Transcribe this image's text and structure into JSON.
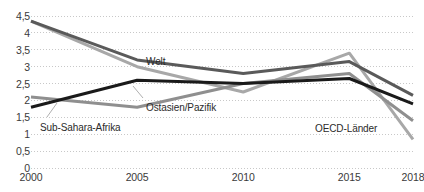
{
  "chart_data": {
    "type": "line",
    "title": "",
    "xlabel": "",
    "ylabel": "",
    "x": [
      2000,
      2005,
      2010,
      2015,
      2018
    ],
    "categories": [
      "2000",
      "2005",
      "2010",
      "2015",
      "2018"
    ],
    "xlim": [
      2000,
      2018
    ],
    "ylim": [
      0,
      4.5
    ],
    "ytick_values": [
      0,
      0.5,
      1,
      1.5,
      2,
      2.5,
      3,
      3.5,
      4,
      4.5
    ],
    "ytick_labels": [
      "0",
      "0,5",
      "1",
      "1,5",
      "2",
      "2,5",
      "3",
      "3,5",
      "4",
      "4,5"
    ],
    "xtick_labels": [
      "2000",
      "2005",
      "2010",
      "2015",
      "2018"
    ],
    "grid": "horizontal-dotted",
    "legend_position": "inline-annotations",
    "series": [
      {
        "name": "Welt",
        "color": "#5a5a5a",
        "values": [
          4.35,
          3.2,
          2.8,
          3.15,
          2.15
        ]
      },
      {
        "name": "Ostasien/Pazifik",
        "color": "#a8a8a8",
        "values": [
          4.35,
          3.0,
          2.25,
          3.4,
          0.85
        ]
      },
      {
        "name": "Sub-Sahara-Afrika",
        "color": "#1a1a1a",
        "values": [
          1.8,
          2.6,
          2.5,
          2.65,
          1.9
        ]
      },
      {
        "name": "OECD-Länder",
        "color": "#8f8f8f",
        "values": [
          2.1,
          1.8,
          2.5,
          2.8,
          1.4
        ]
      }
    ],
    "annotations": [
      {
        "text": "Welt",
        "x": 146,
        "y": 57
      },
      {
        "text": "Ostasien/Pazifik",
        "x": 146,
        "y": 103
      },
      {
        "text": "Sub-Sahara-Afrika",
        "x": 40,
        "y": 123
      },
      {
        "text": "OECD-Länder",
        "x": 315,
        "y": 124
      }
    ],
    "leader_lines": [
      {
        "x1": 47,
        "y1": 117,
        "x2": 57,
        "y2": 103
      },
      {
        "x1": 143,
        "y1": 98,
        "x2": 133,
        "y2": 86
      }
    ]
  },
  "axis_colors": {
    "grid": "#c8c8c8",
    "tick_text": "#3a3a3a"
  }
}
